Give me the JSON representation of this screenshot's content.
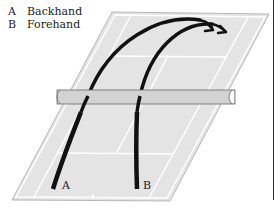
{
  "legend": {
    "items": [
      {
        "key": "A",
        "label": "Backhand"
      },
      {
        "key": "B",
        "label": "Forehand"
      }
    ]
  },
  "shots": [
    {
      "id": "backhand",
      "key": "A"
    },
    {
      "id": "forehand",
      "key": "B"
    }
  ],
  "colors": {
    "court_surface": "#e3e3e3",
    "court_lines": "#ffffff",
    "court_outline": "#a8a8a8",
    "net_fill": "#d2d2d2",
    "net_stroke": "#6a6a6a",
    "shot_path": "#111111",
    "frame_line": "#333333"
  }
}
